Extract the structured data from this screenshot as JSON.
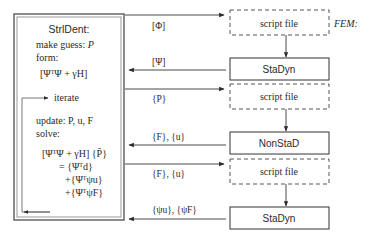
{
  "left_panel": {
    "title": "StrlDent:",
    "line_make_guess": "make guess: ",
    "line_make_guess_var": "P",
    "line_form": "form:",
    "matrix_form": "[ΨᵀΨ + γH]",
    "iterate_label": "iterate",
    "line_update": "update: P, u, F",
    "line_solve": "solve:",
    "eq_line1": "[ΨᵀΨ + γH] {P̄}",
    "eq_line2": "= {Ψᵀd}",
    "eq_line3": "+{Ψᵀψu}",
    "eq_line4": "+{ΨᵀψF}"
  },
  "fem_label": "FEM:",
  "arrows": [
    {
      "label": "[Φ]",
      "direction": "right"
    },
    {
      "label": "[Ψ]",
      "direction": "left"
    },
    {
      "label": "{P}",
      "direction": "right"
    },
    {
      "label": "{F}, {u}",
      "direction": "left"
    },
    {
      "label": "{F}, {u}",
      "direction": "right"
    },
    {
      "label": "{ψu}, {ψF}",
      "direction": "left"
    }
  ],
  "boxes": [
    {
      "label": "script file",
      "style": "dashed"
    },
    {
      "label": "StaDyn",
      "style": "solid"
    },
    {
      "label": "script file",
      "style": "dashed"
    },
    {
      "label": "NonStaD",
      "style": "solid"
    },
    {
      "label": "script file",
      "style": "dashed"
    },
    {
      "label": "StaDyn",
      "style": "solid"
    }
  ]
}
